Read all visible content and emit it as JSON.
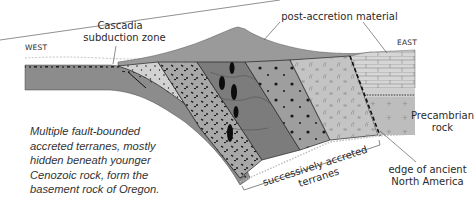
{
  "diagram": {
    "labels": {
      "west": "WEST",
      "east": "EAST",
      "cascadia_line1": "Cascadia",
      "cascadia_line2": "subduction zone",
      "post_accretion": "post-accretion material",
      "precambrian_line1": "Precambrian",
      "precambrian_line2": "rock",
      "edge_line1": "edge of ancient",
      "edge_line2": "North America",
      "terranes_line1": "successively accreted",
      "terranes_line2": "terranes"
    },
    "caption": {
      "line1": "Multiple fault-bounded",
      "line2": "accreted terranes, mostly",
      "line3": "hidden beneath younger",
      "line4": "Cenozoic rock, form the",
      "line5": "basement rock of Oregon."
    },
    "colors": {
      "oceanic_plate": "#8c8c8c",
      "post_accretion": "#9a9a9a",
      "terrane_light": "#d2d2d2",
      "terrane_mid": "#a8a8a8",
      "terrane_dark": "#7c7c7c",
      "terrane_gray": "#9e9e9e",
      "terrane_pale": "#c4c4c4",
      "craton": "#bdbdbd",
      "ink": "#1a1a1a"
    }
  }
}
